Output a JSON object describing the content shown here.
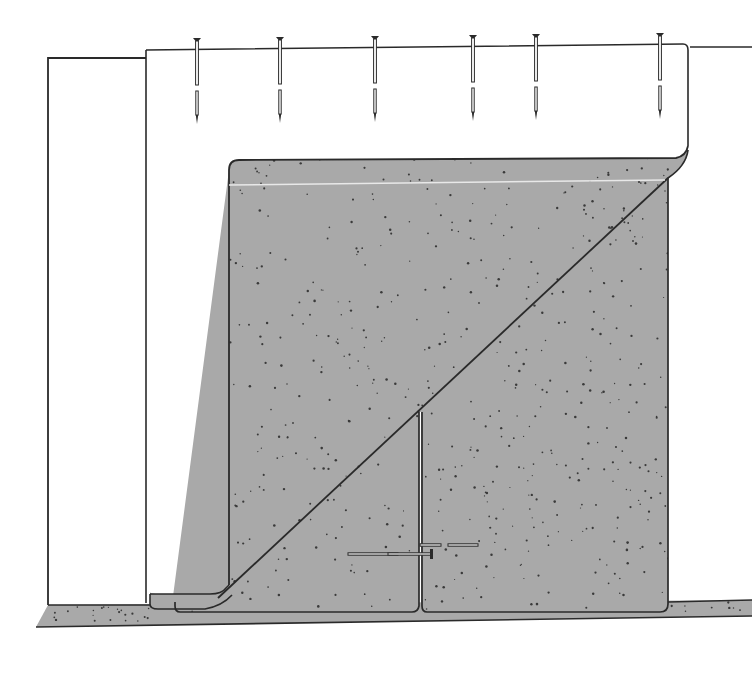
{
  "canvas": {
    "width": 752,
    "height": 683,
    "background": "#ffffff"
  },
  "colors": {
    "stroke": "#2a2a2a",
    "fill_gray": "#a9a9a9",
    "speckle": "#3a3a3a",
    "highlight": "#e8e8e8",
    "paper": "#ffffff"
  },
  "diagram": {
    "nails": [
      {
        "x": 197,
        "head_y": 38
      },
      {
        "x": 280,
        "head_y": 37
      },
      {
        "x": 375,
        "head_y": 36
      },
      {
        "x": 473,
        "head_y": 35
      },
      {
        "x": 536,
        "head_y": 34
      },
      {
        "x": 660,
        "head_y": 33
      }
    ],
    "horizontal_nails": [
      {
        "x1": 348,
        "x2": 398,
        "y": 554
      },
      {
        "x1": 388,
        "x2": 432,
        "y": 554
      },
      {
        "x1": 420,
        "x2": 441,
        "y": 545
      },
      {
        "x1": 448,
        "x2": 478,
        "y": 545
      }
    ]
  }
}
